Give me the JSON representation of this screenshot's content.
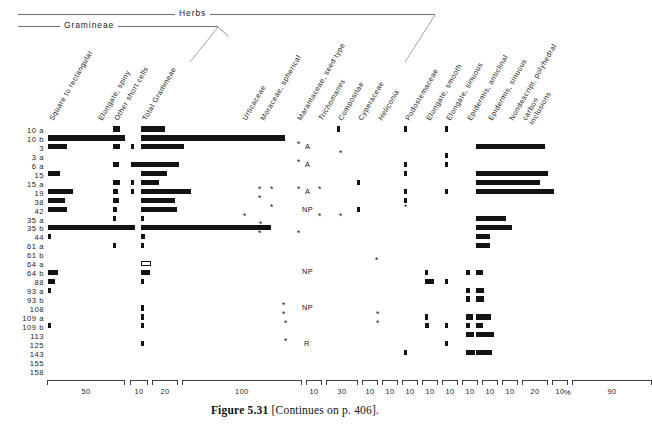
{
  "figure": {
    "caption_label": "Figure 5.31",
    "caption_text": "[Continues on p. 406].",
    "unit_symbol": "%"
  },
  "groups": [
    {
      "label": "Herbs",
      "x": 18,
      "y": 14,
      "width": 417,
      "label_x": 175
    },
    {
      "label": "Gramineae",
      "x": 18,
      "y": 26,
      "width": 200,
      "label_x": 60
    }
  ],
  "columns": [
    {
      "name": "square-to-rectangular",
      "label": "Square to rectangular",
      "italic": false,
      "x": 48
    },
    {
      "name": "elongate-spiny",
      "label": "Elongate, spiny",
      "italic": false,
      "x": 97
    },
    {
      "name": "other-short-cells",
      "label": "Other short cells",
      "italic": false,
      "x": 113
    },
    {
      "name": "total-gramineae",
      "label": "Total Gramineae",
      "italic": false,
      "x": 141
    },
    {
      "name": "urticaceae",
      "label": "Urticaceae",
      "italic": false,
      "x": 241
    },
    {
      "name": "moraceae-spherical",
      "label": "Moraceae, spherical",
      "italic": false,
      "x": 259
    },
    {
      "name": "marantaceae-seed-type",
      "label": "Marantaceae, seed type",
      "italic": false,
      "x": 296
    },
    {
      "name": "trichomanes",
      "label": "Trichomanes",
      "italic": true,
      "x": 317
    },
    {
      "name": "compositae",
      "label": "Compositae",
      "italic": false,
      "x": 337
    },
    {
      "name": "cyperaceae",
      "label": "Cyperaceae",
      "italic": false,
      "x": 357
    },
    {
      "name": "heliconia",
      "label": "Heliconia",
      "italic": true,
      "x": 377
    },
    {
      "name": "podostemaceae",
      "label": "Podostemaceae",
      "italic": false,
      "x": 404
    },
    {
      "name": "elongate-smooth",
      "label": "Elongate, smooth",
      "italic": false,
      "x": 425
    },
    {
      "name": "elongate-sinuous",
      "label": "Elongate, sinuous",
      "italic": false,
      "x": 445
    },
    {
      "name": "epidermis-anticlinal",
      "label": "Epidermis, anticlinal",
      "italic": false,
      "x": 466
    },
    {
      "name": "epidermis-sinuous",
      "label": "Epidermis, sinuous",
      "italic": false,
      "x": 487
    },
    {
      "name": "nondescript-polyhedral",
      "label": "Nondescript, polyhedral",
      "label2": "",
      "italic": false,
      "x": 508
    },
    {
      "name": "carbon-inclusions",
      "label": "carbon",
      "label2": "inclusions",
      "italic": false,
      "x": 521
    }
  ],
  "rows": [
    "10 a",
    "10 b",
    "3",
    "3 a",
    "6 a",
    "15",
    "15 a",
    "19",
    "38",
    "42",
    "35 a",
    "35 b",
    "44",
    "61 a",
    "61 b",
    "64 a",
    "64 b",
    "88",
    "93 a",
    "93 b",
    "108",
    "109 a",
    "109 b",
    "113",
    "125",
    "143",
    "155",
    "158"
  ],
  "axis": {
    "segments": [
      {
        "x": 47,
        "width": 78,
        "label": "50"
      },
      {
        "x": 130,
        "width": 18,
        "label": "10"
      },
      {
        "x": 152,
        "width": 26,
        "label": "20"
      },
      {
        "x": 182,
        "width": 120,
        "label": "100"
      },
      {
        "x": 306,
        "width": 16,
        "label": "10"
      },
      {
        "x": 326,
        "width": 32,
        "label": "30"
      },
      {
        "x": 362,
        "width": 16,
        "label": "10"
      },
      {
        "x": 382,
        "width": 16,
        "label": "10"
      },
      {
        "x": 402,
        "width": 16,
        "label": "10"
      },
      {
        "x": 422,
        "width": 16,
        "label": "10"
      },
      {
        "x": 442,
        "width": 16,
        "label": "10"
      },
      {
        "x": 462,
        "width": 16,
        "label": "10"
      },
      {
        "x": 482,
        "width": 16,
        "label": "10"
      },
      {
        "x": 502,
        "width": 16,
        "label": "10"
      },
      {
        "x": 522,
        "width": 26,
        "label": "20"
      },
      {
        "x": 552,
        "width": 16,
        "label": "10"
      },
      {
        "x": 572,
        "width": 80,
        "label": "90"
      }
    ],
    "unit_x": 564,
    "unit_y": 388
  },
  "chart_data": {
    "type": "bar",
    "xlabel": "%",
    "ylabel": "Sample",
    "orientation": "horizontal-stratigraphic",
    "categories": [
      "10 a",
      "10 b",
      "3",
      "3 a",
      "6 a",
      "15",
      "15 a",
      "19",
      "38",
      "42",
      "35 a",
      "35 b",
      "44",
      "61 a",
      "61 b",
      "64 a",
      "64 b",
      "88",
      "93 a",
      "93 b",
      "108",
      "109 a",
      "109 b",
      "113",
      "125",
      "143",
      "155",
      "158"
    ],
    "series": [
      {
        "name": "Square to rectangular",
        "values": [
          0,
          50,
          11,
          0,
          0,
          9,
          0,
          18,
          13,
          14,
          0,
          57,
          2,
          0,
          0,
          0,
          10,
          7,
          3,
          0,
          0,
          0,
          2,
          0,
          0,
          0,
          0,
          0
        ]
      },
      {
        "name": "Elongate, spiny",
        "values": [
          4,
          0,
          4,
          0,
          4,
          0,
          0,
          4,
          3,
          4,
          2,
          2,
          0,
          0,
          2,
          0,
          0,
          0,
          0,
          0,
          0,
          2,
          2,
          0,
          1,
          0,
          0,
          0
        ]
      },
      {
        "name": "Other short cells",
        "values": [
          0,
          0,
          2,
          0,
          6,
          0,
          0,
          2,
          2,
          0,
          1,
          0,
          1,
          0,
          1,
          0,
          0,
          0,
          0,
          0,
          0,
          3,
          3,
          0,
          1,
          0,
          0,
          0
        ]
      },
      {
        "name": "Total Gramineae",
        "values": [
          9,
          100,
          27,
          0,
          24,
          16,
          11,
          32,
          19,
          22,
          2,
          87,
          3,
          2,
          1,
          1,
          6,
          2,
          0,
          2,
          2,
          2,
          0,
          0,
          2,
          0,
          0,
          0
        ]
      },
      {
        "name": "Urticaceae",
        "values": [
          0,
          0,
          0,
          0,
          0,
          0,
          0,
          0,
          0,
          0,
          2,
          0,
          0,
          0,
          0,
          0,
          0,
          0,
          0,
          0,
          0,
          0,
          0,
          0,
          0,
          0,
          0,
          0
        ]
      },
      {
        "name": "Moraceae, spherical",
        "values": [
          0,
          0,
          0,
          0,
          0,
          0,
          0,
          6,
          4,
          0,
          0,
          4,
          5,
          0,
          0,
          0,
          0,
          0,
          0,
          0,
          5,
          3,
          0,
          3,
          11,
          0,
          9,
          0
        ]
      },
      {
        "name": "Marantaceae, seed type",
        "values": [
          0,
          0,
          0,
          0,
          0,
          0,
          0,
          0,
          0,
          0,
          0,
          0,
          0,
          0,
          0,
          0,
          0,
          0,
          0,
          0,
          0,
          0,
          0,
          0,
          0,
          0,
          0,
          0
        ]
      },
      {
        "name": "Trichomanes",
        "values": [
          0,
          0,
          0,
          0,
          0,
          0,
          0,
          0,
          0,
          0,
          0,
          0,
          0,
          0,
          0,
          0,
          0,
          0,
          0,
          0,
          0,
          0,
          0,
          0,
          0,
          0,
          0,
          0
        ]
      },
      {
        "name": "Compositae",
        "values": [
          0,
          4,
          0,
          0,
          0,
          0,
          0,
          0,
          0,
          0,
          0,
          0,
          0,
          0,
          0,
          0,
          0,
          0,
          0,
          0,
          0,
          0,
          0,
          0,
          0,
          0,
          0,
          0
        ]
      },
      {
        "name": "Cyperaceae",
        "values": [
          0,
          0,
          0,
          0,
          0,
          0,
          0,
          4,
          0,
          0,
          0,
          0,
          0,
          0,
          0,
          0,
          0,
          0,
          0,
          0,
          0,
          0,
          0,
          0,
          0,
          0,
          0,
          0
        ]
      },
      {
        "name": "Heliconia",
        "values": [
          0,
          0,
          0,
          0,
          0,
          0,
          0,
          0,
          0,
          0,
          0,
          0,
          0,
          0,
          0,
          0,
          0,
          0,
          0,
          0,
          0,
          0,
          0,
          0,
          0,
          0,
          0,
          0
        ]
      },
      {
        "name": "Podostemaceae",
        "values": [
          0,
          0,
          0,
          0,
          0,
          0,
          0,
          5,
          0,
          0,
          4,
          0,
          0,
          0,
          0,
          0,
          0,
          0,
          0,
          0,
          0,
          0,
          0,
          0,
          0,
          0,
          0,
          0
        ]
      },
      {
        "name": "Elongate, smooth",
        "values": [
          0,
          0,
          0,
          0,
          0,
          0,
          0,
          0,
          0,
          0,
          0,
          0,
          0,
          0,
          0,
          0,
          5,
          0,
          0,
          0,
          0,
          0,
          3,
          4,
          0,
          0,
          0,
          0
        ]
      },
      {
        "name": "Elongate, sinuous",
        "values": [
          4,
          0,
          0,
          7,
          6,
          0,
          6,
          5,
          0,
          3,
          0,
          0,
          0,
          0,
          0,
          0,
          8,
          0,
          0,
          0,
          0,
          0,
          0,
          0,
          0,
          0,
          0,
          0
        ]
      },
      {
        "name": "Epidermis, anticlinal",
        "values": [
          0,
          0,
          0,
          0,
          0,
          0,
          0,
          0,
          0,
          0,
          0,
          0,
          0,
          0,
          0,
          0,
          3,
          3,
          0,
          0,
          0,
          0,
          3,
          3,
          0,
          3,
          0,
          0
        ]
      },
      {
        "name": "Epidermis, sinuous",
        "values": [
          0,
          0,
          0,
          0,
          0,
          0,
          0,
          0,
          0,
          0,
          0,
          0,
          0,
          0,
          0,
          0,
          0,
          0,
          0,
          0,
          0,
          0,
          0,
          0,
          0,
          0,
          0,
          0
        ]
      },
      {
        "name": "Nondescript, polyhedral carbon inclusions",
        "values": [
          0,
          0,
          78,
          0,
          0,
          82,
          76,
          88,
          0,
          0,
          0,
          34,
          40,
          12,
          14,
          0,
          10,
          0,
          16,
          16,
          0,
          20,
          10,
          26,
          0,
          24,
          0,
          0
        ]
      }
    ],
    "special_markers": [
      {
        "row": "6 a",
        "column": "Marantaceae, seed type",
        "symbol": "A"
      },
      {
        "row": "15",
        "column": "Marantaceae, seed type",
        "symbol": "A"
      },
      {
        "row": "19",
        "column": "Marantaceae, seed type",
        "symbol": "A"
      },
      {
        "row": "42",
        "column": "Marantaceae, seed type",
        "symbol": "NP"
      },
      {
        "row": "64 b",
        "column": "Marantaceae, seed type",
        "symbol": "NP"
      },
      {
        "row": "108",
        "column": "Marantaceae, seed type",
        "symbol": "NP"
      },
      {
        "row": "125",
        "column": "Marantaceae, seed type",
        "symbol": "R"
      }
    ],
    "axis_note": "Each taxon column has its own scale bracket; values read in percent.",
    "grid": false,
    "legend": "none"
  },
  "marks": [
    {
      "t": "bar",
      "c": 1,
      "r": 0,
      "x": 113,
      "w": 7
    },
    {
      "t": "bar",
      "c": 3,
      "r": 0,
      "x": 141,
      "w": 24
    },
    {
      "t": "bar",
      "c": 0,
      "r": 1,
      "x": 48,
      "w": 77
    },
    {
      "t": "bar",
      "c": 3,
      "r": 1,
      "x": 141,
      "w": 144
    },
    {
      "t": "bar",
      "c": 17,
      "r": 1,
      "x": 476,
      "w": 0
    },
    {
      "t": "bar",
      "c": 0,
      "r": 2,
      "x": 48,
      "w": 19
    },
    {
      "t": "bar",
      "c": 1,
      "r": 2,
      "x": 113,
      "w": 7
    },
    {
      "t": "bar",
      "c": 2,
      "r": 2,
      "x": 131,
      "w": 3
    },
    {
      "t": "bar",
      "c": 3,
      "r": 2,
      "x": 141,
      "w": 43
    },
    {
      "t": "bar",
      "c": 17,
      "r": 2,
      "x": 476,
      "w": 69
    },
    {
      "t": "bar",
      "c": 1,
      "r": 4,
      "x": 113,
      "w": 6
    },
    {
      "t": "bar",
      "c": 2,
      "r": 4,
      "x": 131,
      "w": 13
    },
    {
      "t": "bar",
      "c": 3,
      "r": 4,
      "x": 141,
      "w": 38
    },
    {
      "t": "bar",
      "c": 0,
      "r": 5,
      "x": 48,
      "w": 12
    },
    {
      "t": "bar",
      "c": 3,
      "r": 5,
      "x": 141,
      "w": 26
    },
    {
      "t": "bar",
      "c": 17,
      "r": 5,
      "x": 476,
      "w": 72
    },
    {
      "t": "bar",
      "c": 1,
      "r": 6,
      "x": 113,
      "w": 7
    },
    {
      "t": "bar",
      "c": 2,
      "r": 6,
      "x": 131,
      "w": 3
    },
    {
      "t": "bar",
      "c": 3,
      "r": 6,
      "x": 141,
      "w": 18
    },
    {
      "t": "bar",
      "c": 17,
      "r": 6,
      "x": 476,
      "w": 64
    },
    {
      "t": "bar",
      "c": 0,
      "r": 7,
      "x": 48,
      "w": 25
    },
    {
      "t": "bar",
      "c": 1,
      "r": 7,
      "x": 113,
      "w": 5
    },
    {
      "t": "bar",
      "c": 2,
      "r": 7,
      "x": 131,
      "w": 3
    },
    {
      "t": "bar",
      "c": 3,
      "r": 7,
      "x": 141,
      "w": 50
    },
    {
      "t": "bar",
      "c": 17,
      "r": 7,
      "x": 476,
      "w": 78
    },
    {
      "t": "bar",
      "c": 0,
      "r": 8,
      "x": 48,
      "w": 17
    },
    {
      "t": "bar",
      "c": 1,
      "r": 8,
      "x": 113,
      "w": 6
    },
    {
      "t": "bar",
      "c": 3,
      "r": 8,
      "x": 141,
      "w": 34
    },
    {
      "t": "bar",
      "c": 0,
      "r": 9,
      "x": 48,
      "w": 19
    },
    {
      "t": "bar",
      "c": 1,
      "r": 9,
      "x": 113,
      "w": 4
    },
    {
      "t": "bar",
      "c": 3,
      "r": 9,
      "x": 141,
      "w": 36
    },
    {
      "t": "bar",
      "c": 1,
      "r": 10,
      "x": 113,
      "w": 3
    },
    {
      "t": "bar",
      "c": 3,
      "r": 10,
      "x": 141,
      "w": 3
    },
    {
      "t": "bar",
      "c": 17,
      "r": 10,
      "x": 476,
      "w": 30
    },
    {
      "t": "bar",
      "c": 0,
      "r": 11,
      "x": 48,
      "w": 87
    },
    {
      "t": "bar",
      "c": 3,
      "r": 11,
      "x": 141,
      "w": 130
    },
    {
      "t": "bar",
      "c": 17,
      "r": 11,
      "x": 476,
      "w": 36
    },
    {
      "t": "bar",
      "c": 0,
      "r": 12,
      "x": 48,
      "w": 3
    },
    {
      "t": "bar",
      "c": 3,
      "r": 12,
      "x": 141,
      "w": 4
    },
    {
      "t": "bar",
      "c": 17,
      "r": 12,
      "x": 476,
      "w": 11
    },
    {
      "t": "bar",
      "c": 1,
      "r": 13,
      "x": 113,
      "w": 3
    },
    {
      "t": "bar",
      "c": 3,
      "r": 13,
      "x": 141,
      "w": 3
    },
    {
      "t": "bar",
      "c": 17,
      "r": 13,
      "x": 476,
      "w": 13
    },
    {
      "t": "bar",
      "c": 3,
      "r": 15,
      "x": 141,
      "w": 10,
      "hollow": true
    },
    {
      "t": "bar",
      "c": 0,
      "r": 16,
      "x": 48,
      "w": 10
    },
    {
      "t": "bar",
      "c": 3,
      "r": 16,
      "x": 141,
      "w": 9
    },
    {
      "t": "bar",
      "c": 17,
      "r": 16,
      "x": 476,
      "w": 7
    },
    {
      "t": "bar",
      "c": 0,
      "r": 17,
      "x": 48,
      "w": 7
    },
    {
      "t": "bar",
      "c": 3,
      "r": 17,
      "x": 141,
      "w": 3
    },
    {
      "t": "bar",
      "c": 0,
      "r": 18,
      "x": 48,
      "w": 3
    },
    {
      "t": "bar",
      "c": 17,
      "r": 18,
      "x": 476,
      "w": 8
    },
    {
      "t": "bar",
      "c": 17,
      "r": 19,
      "x": 476,
      "w": 8
    },
    {
      "t": "bar",
      "c": 3,
      "r": 20,
      "x": 141,
      "w": 3
    },
    {
      "t": "bar",
      "c": 3,
      "r": 21,
      "x": 141,
      "w": 3
    },
    {
      "t": "bar",
      "c": 17,
      "r": 21,
      "x": 476,
      "w": 15
    },
    {
      "t": "bar",
      "c": 0,
      "r": 22,
      "x": 48,
      "w": 3
    },
    {
      "t": "bar",
      "c": 3,
      "r": 22,
      "x": 141,
      "w": 3
    },
    {
      "t": "bar",
      "c": 17,
      "r": 22,
      "x": 476,
      "w": 7
    },
    {
      "t": "bar",
      "c": 17,
      "r": 23,
      "x": 476,
      "w": 18
    },
    {
      "t": "bar",
      "c": 3,
      "r": 24,
      "x": 141,
      "w": 3
    },
    {
      "t": "bar",
      "c": 17,
      "r": 25,
      "x": 476,
      "w": 16
    }
  ]
}
